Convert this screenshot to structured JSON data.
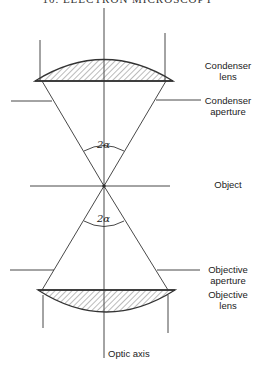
{
  "header": {
    "text": "10.  ELECTRON MICROSCOPY"
  },
  "labels": {
    "condenser_lens": [
      "Condenser",
      "lens"
    ],
    "condenser_aperture": [
      "Condenser",
      "aperture"
    ],
    "object": "Object",
    "objective_aperture": [
      "Objective",
      "aperture"
    ],
    "objective_lens": [
      "Objective",
      "lens"
    ],
    "optic_axis": "Optic axis",
    "angle_top": "2α",
    "angle_bottom": "2α"
  },
  "colors": {
    "line": "#333333",
    "hatch": "#555555"
  }
}
